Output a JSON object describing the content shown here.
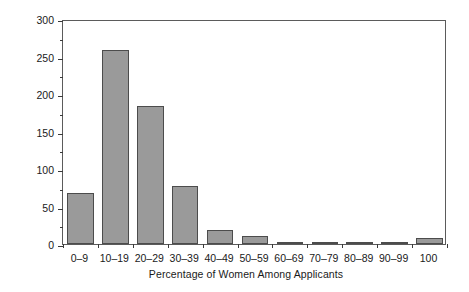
{
  "chart_data": {
    "type": "bar",
    "title": "",
    "xlabel": "Percentage of Women Among Applicants",
    "ylabel": "Number of Positions",
    "categories": [
      "0–9",
      "10–19",
      "20–29",
      "30–39",
      "40–49",
      "50–59",
      "60–69",
      "70–79",
      "80–89",
      "90–99",
      "100"
    ],
    "values": [
      68,
      259,
      184,
      78,
      19,
      11,
      2,
      1,
      1,
      2,
      8
    ],
    "ylim": [
      0,
      300
    ],
    "ytick_major": [
      0,
      50,
      100,
      150,
      200,
      250,
      300
    ],
    "ytick_minor": [
      25,
      75,
      125,
      175,
      225,
      275
    ],
    "ytick_labels": [
      "0",
      "50",
      "100",
      "150",
      "200",
      "250",
      "300"
    ],
    "grid": false,
    "legend": null,
    "bar_color": "#9a9a9a",
    "bar_edge_color": "#4c4c4c",
    "axis_color": "#5b5b5b"
  }
}
